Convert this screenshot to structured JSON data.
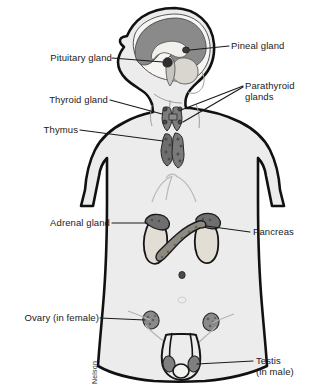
{
  "figure": {
    "credit": "Nelson",
    "colors": {
      "body_fill": "#ececec",
      "outline": "#111111",
      "brain_cerebrum": "#8a8a8a",
      "brain_inner": "#f2f0ec",
      "gland_dark": "#6e6e6e",
      "gland_mid": "#9a9a9a",
      "organ_light": "#e2ded6",
      "leader_line": "#1a1a1a",
      "text": "#1a1a1a",
      "background": "#ffffff"
    }
  },
  "labels": {
    "pituitary": "Pituitary gland",
    "pineal": "Pineal gland",
    "thyroid": "Thyroid gland",
    "parathyroid_line1": "Parathyroid",
    "parathyroid_line2": "glands",
    "thymus": "Thymus",
    "adrenal": "Adrenal gland",
    "pancreas": "Pancreas",
    "ovary": "Ovary (in female)",
    "testis_line1": "Testis",
    "testis_line2": "(in male)"
  },
  "structures": [
    {
      "name": "pituitary-gland",
      "region": "head",
      "side": "left"
    },
    {
      "name": "pineal-gland",
      "region": "head",
      "side": "right"
    },
    {
      "name": "cerebrum",
      "region": "head",
      "side": "none"
    },
    {
      "name": "cerebellum",
      "region": "head",
      "side": "none"
    },
    {
      "name": "thyroid-gland",
      "region": "neck",
      "side": "left"
    },
    {
      "name": "parathyroid-glands",
      "region": "neck",
      "side": "right"
    },
    {
      "name": "thymus",
      "region": "upper-chest",
      "side": "left"
    },
    {
      "name": "adrenal-gland",
      "region": "abdomen",
      "side": "left"
    },
    {
      "name": "kidney-left",
      "region": "abdomen",
      "side": "none"
    },
    {
      "name": "kidney-right",
      "region": "abdomen",
      "side": "none"
    },
    {
      "name": "pancreas",
      "region": "abdomen",
      "side": "right"
    },
    {
      "name": "ovary",
      "region": "pelvis",
      "side": "left"
    },
    {
      "name": "testis",
      "region": "pelvis",
      "side": "right"
    }
  ]
}
